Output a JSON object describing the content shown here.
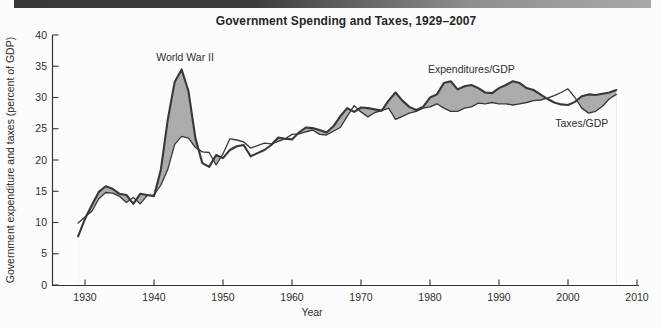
{
  "page": {
    "title": "Government Spending and Taxes, 1929–2007"
  },
  "colors": {
    "background": "#fcfcfc",
    "deficit_fill": "#acacac",
    "line": "#383838",
    "axis": "#333333",
    "text": "#2e2e2e",
    "header_bar_left": "#373737",
    "header_bar_right": "#a9a9a9"
  },
  "chart_data": {
    "type": "line",
    "title": "Government Spending and Taxes, 1929–2007",
    "xlabel": "Year",
    "ylabel": "Government expenditure and taxes (percent of GDP)",
    "xlim": [
      1929,
      2010
    ],
    "ylim": [
      0,
      40
    ],
    "x_ticks": [
      1930,
      1940,
      1950,
      1960,
      1970,
      1980,
      1990,
      2000,
      2010
    ],
    "y_ticks": [
      0,
      5,
      10,
      15,
      20,
      25,
      30,
      35,
      40
    ],
    "grid": false,
    "legend_position": "inline-annotations",
    "shading_note": "area between curves shaded gray where Expenditures/GDP exceeds Taxes/GDP",
    "x": [
      1929,
      1930,
      1931,
      1932,
      1933,
      1934,
      1935,
      1936,
      1937,
      1938,
      1939,
      1940,
      1941,
      1942,
      1943,
      1944,
      1945,
      1946,
      1947,
      1948,
      1949,
      1950,
      1951,
      1952,
      1953,
      1954,
      1955,
      1956,
      1957,
      1958,
      1959,
      1960,
      1961,
      1962,
      1963,
      1964,
      1965,
      1966,
      1967,
      1968,
      1969,
      1970,
      1971,
      1972,
      1973,
      1974,
      1975,
      1976,
      1977,
      1978,
      1979,
      1980,
      1981,
      1982,
      1983,
      1984,
      1985,
      1986,
      1987,
      1988,
      1989,
      1990,
      1991,
      1992,
      1993,
      1994,
      1995,
      1996,
      1997,
      1998,
      1999,
      2000,
      2001,
      2002,
      2003,
      2004,
      2005,
      2006,
      2007
    ],
    "series": [
      {
        "name": "Expenditures/GDP",
        "values": [
          7.8,
          10.6,
          12.8,
          14.9,
          15.8,
          15.4,
          14.6,
          14.4,
          13.0,
          14.6,
          14.4,
          14.2,
          18.5,
          26.5,
          32.5,
          34.5,
          31.0,
          23.5,
          19.5,
          18.9,
          20.8,
          20.3,
          21.6,
          22.2,
          22.4,
          20.6,
          21.1,
          21.6,
          22.4,
          23.6,
          23.4,
          23.3,
          24.4,
          25.2,
          25.1,
          24.8,
          24.4,
          25.4,
          27.0,
          28.3,
          27.7,
          28.4,
          28.3,
          28.1,
          27.9,
          29.5,
          30.8,
          29.5,
          28.5,
          28.0,
          28.5,
          30.0,
          30.5,
          32.3,
          32.6,
          31.3,
          31.8,
          32.0,
          31.5,
          30.8,
          30.7,
          31.5,
          32.0,
          32.6,
          32.3,
          31.5,
          31.2,
          30.5,
          29.8,
          29.2,
          28.9,
          28.8,
          29.3,
          30.2,
          30.5,
          30.4,
          30.6,
          30.8,
          31.2
        ]
      },
      {
        "name": "Taxes/GDP",
        "values": [
          9.9,
          10.9,
          11.8,
          13.8,
          14.8,
          14.7,
          14.2,
          13.2,
          14.0,
          13.0,
          14.3,
          14.4,
          16.0,
          18.5,
          22.5,
          23.8,
          23.5,
          22.0,
          21.3,
          21.2,
          19.2,
          21.0,
          23.4,
          23.2,
          22.9,
          21.9,
          22.3,
          22.7,
          22.6,
          23.0,
          23.4,
          24.1,
          24.2,
          24.5,
          24.8,
          24.1,
          24.0,
          24.6,
          25.2,
          27.0,
          28.7,
          27.7,
          26.9,
          27.6,
          27.9,
          28.3,
          26.5,
          27.0,
          27.5,
          27.8,
          28.3,
          28.5,
          29.0,
          28.3,
          27.8,
          27.8,
          28.3,
          28.5,
          29.1,
          29.0,
          29.2,
          29.0,
          29.0,
          28.8,
          29.0,
          29.2,
          29.5,
          29.6,
          29.9,
          30.3,
          30.8,
          31.4,
          30.0,
          28.3,
          27.5,
          27.8,
          28.6,
          29.8,
          30.5
        ]
      }
    ],
    "annotations": [
      {
        "name": "world-war-ii-label",
        "text": "World War II",
        "year": 1944.5,
        "value": 35.9
      },
      {
        "name": "expenditures-series-label",
        "text": "Expenditures/GDP",
        "year": 1986,
        "value": 33.9
      },
      {
        "name": "taxes-series-label",
        "text": "Taxes/GDP",
        "year": 2002,
        "value": 25.3
      }
    ]
  }
}
